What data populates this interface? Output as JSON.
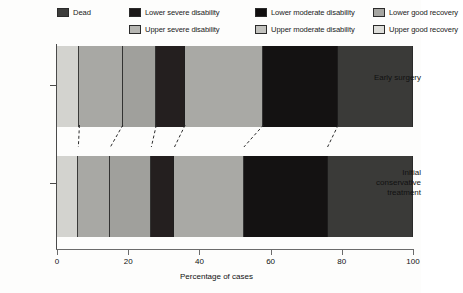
{
  "chart_data": {
    "type": "bar",
    "orientation": "horizontal",
    "stacked": true,
    "normalized": true,
    "title": "",
    "xlabel": "Percentage of cases",
    "ylabel": "",
    "xlim": [
      0,
      100
    ],
    "xticks": [
      0,
      20,
      40,
      60,
      80,
      100
    ],
    "xtick_labels": [
      "0",
      "20",
      "40",
      "60",
      "80",
      "100"
    ],
    "grid": false,
    "legend_position": "top",
    "categories": [
      "Early surgery",
      "Initial conservative treatment"
    ],
    "series": [
      {
        "name": "Dead",
        "color": "#d3d3cf",
        "values": [
          6.3,
          6.0
        ]
      },
      {
        "name": "Lower severe disability",
        "color": "#a8a8a4",
        "values": [
          12.2,
          9.0
        ]
      },
      {
        "name": "Upper severe disability",
        "color": "#a0a09c",
        "values": [
          9.4,
          11.5
        ]
      },
      {
        "name": "Lower moderate disability",
        "color": "#241f1f",
        "values": [
          8.1,
          6.5
        ]
      },
      {
        "name": "Upper moderate disability",
        "color": "#a9a9a5",
        "values": [
          22.0,
          19.5
        ]
      },
      {
        "name": "Lower good recovery",
        "color": "#141212",
        "values": [
          21.0,
          23.5
        ]
      },
      {
        "name": "Upper good recovery",
        "color": "#3a3a38",
        "values": [
          21.0,
          24.0
        ]
      }
    ],
    "cumulative_boundaries": {
      "Early surgery": [
        0,
        6.3,
        18.5,
        27.9,
        36.0,
        58.0,
        79.0,
        100
      ],
      "Initial conservative treatment": [
        0,
        6.0,
        15.0,
        26.5,
        33.0,
        52.5,
        76.0,
        100
      ]
    }
  },
  "legend": {
    "items": [
      {
        "label": "Dead",
        "color": "#3d3d3b",
        "col": 1,
        "row": 1
      },
      {
        "label": "Lower severe disability",
        "color": "#1b1818",
        "col": 2,
        "row": 1
      },
      {
        "label": "Upper severe disability",
        "color": "#b6b6b2",
        "col": 2,
        "row": 2
      },
      {
        "label": "Lower moderate disability",
        "color": "#100e0e",
        "col": 3,
        "row": 1
      },
      {
        "label": "Upper moderate disability",
        "color": "#c2c2be",
        "col": 3,
        "row": 2
      },
      {
        "label": "Lower good recovery",
        "color": "#a5a5a1",
        "col": 4,
        "row": 1
      },
      {
        "label": "Upper good recovery",
        "color": "#dededa",
        "col": 4,
        "row": 2
      }
    ]
  },
  "axis": {
    "x_title": "Percentage of cases",
    "x_tick_labels": [
      "0",
      "20",
      "40",
      "60",
      "80",
      "100"
    ]
  },
  "y_categories": [
    {
      "label": "Early surgery"
    },
    {
      "label": "Initial conservative treatment"
    }
  ],
  "colors": {
    "dead": "#d3d3cf",
    "lower_severe": "#a8a8a4",
    "upper_severe": "#a0a09c",
    "lower_moderate": "#241f1f",
    "upper_moderate": "#a9a9a5",
    "lower_good": "#141212",
    "upper_good": "#3a3a38",
    "axis": "#4a4a4a",
    "text": "#111111"
  }
}
